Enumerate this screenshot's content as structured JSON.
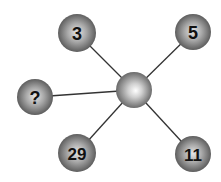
{
  "diagram": {
    "type": "star-number-puzzle",
    "center": {
      "label": "",
      "x": 134,
      "y": 90,
      "r": 18
    },
    "nodes": [
      {
        "id": "top-left",
        "label": "3",
        "x": 77,
        "y": 33,
        "r": 19
      },
      {
        "id": "top-right",
        "label": "5",
        "x": 193,
        "y": 32,
        "r": 18
      },
      {
        "id": "left",
        "label": "?",
        "x": 35,
        "y": 97,
        "r": 18
      },
      {
        "id": "bottom-left",
        "label": "29",
        "x": 77,
        "y": 153,
        "r": 19
      },
      {
        "id": "bottom-right",
        "label": "11",
        "x": 193,
        "y": 154,
        "r": 18
      }
    ],
    "colors": {
      "line": "#333333",
      "sphere_light": "#f2f2f2",
      "sphere_mid": "#9a9a9a",
      "sphere_dark": "#4a4a4a",
      "text": "#111111"
    }
  }
}
